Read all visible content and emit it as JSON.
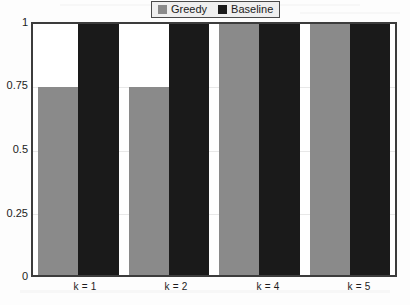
{
  "chart_data": {
    "type": "bar",
    "title": "",
    "subtitle": "",
    "xlabel": "",
    "ylabel": "",
    "categories": [
      "k = 1",
      "k = 2",
      "k = 4",
      "k = 5"
    ],
    "series": [
      {
        "name": "Greedy",
        "color": "#8a8a8a",
        "values": [
          0.75,
          0.75,
          1,
          1
        ]
      },
      {
        "name": "Baseline",
        "color": "#1a1a1a",
        "values": [
          1,
          1,
          1,
          1
        ]
      }
    ],
    "ylim": [
      0,
      1
    ],
    "yticks": [
      "0",
      "0.25",
      "0.5",
      "0.75",
      "1"
    ],
    "ytick_values": [
      0,
      0.25,
      0.5,
      0.75,
      1
    ],
    "grid": true,
    "legend_position": "top-center"
  },
  "legend": {
    "entries": [
      {
        "label": "Greedy",
        "swatch": "greedy-swatch"
      },
      {
        "label": "Baseline",
        "swatch": "baseline-swatch"
      }
    ]
  },
  "axes": {
    "y_labels": [
      "1",
      "0.75",
      "0.5",
      "0.25",
      "0"
    ],
    "x_labels": [
      "k = 1",
      "k = 2",
      "k = 4",
      "k = 5"
    ]
  }
}
